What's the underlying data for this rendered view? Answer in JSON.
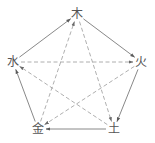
{
  "diagram": {
    "type": "five-elements-cycle",
    "nodes": [
      {
        "id": "wood",
        "label": "木",
        "x": 77,
        "y": 14
      },
      {
        "id": "fire",
        "label": "火",
        "x": 141,
        "y": 62
      },
      {
        "id": "earth",
        "label": "土",
        "x": 114,
        "y": 129
      },
      {
        "id": "metal",
        "label": "金",
        "x": 38,
        "y": 129
      },
      {
        "id": "water",
        "label": "水",
        "x": 13,
        "y": 62
      }
    ],
    "edges": [
      {
        "from": "wood",
        "to": "fire",
        "style": "solid"
      },
      {
        "from": "fire",
        "to": "earth",
        "style": "solid"
      },
      {
        "from": "earth",
        "to": "metal",
        "style": "solid"
      },
      {
        "from": "metal",
        "to": "water",
        "style": "solid"
      },
      {
        "from": "water",
        "to": "wood",
        "style": "solid"
      },
      {
        "from": "wood",
        "to": "earth",
        "style": "dashed"
      },
      {
        "from": "earth",
        "to": "water",
        "style": "dashed"
      },
      {
        "from": "water",
        "to": "fire",
        "style": "dashed"
      },
      {
        "from": "fire",
        "to": "metal",
        "style": "dashed"
      },
      {
        "from": "metal",
        "to": "wood",
        "style": "dashed"
      }
    ],
    "colors": {
      "solid_line": "#6a6a6a",
      "dashed_line": "#9a9a9a",
      "label": "#555555",
      "background": "#ffffff"
    }
  }
}
